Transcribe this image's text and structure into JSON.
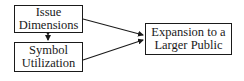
{
  "diagram": {
    "nodes": [
      {
        "id": "issue_dimensions",
        "lines": [
          "Issue",
          "Dimensions"
        ]
      },
      {
        "id": "symbol_utilization",
        "lines": [
          "Symbol",
          "Utilization"
        ]
      },
      {
        "id": "expansion",
        "lines": [
          "Expansion to a",
          "Larger Public"
        ]
      }
    ],
    "edges": [
      {
        "from": "issue_dimensions",
        "to": "symbol_utilization",
        "type": "bidirectional"
      },
      {
        "from": "issue_dimensions",
        "to": "expansion",
        "type": "directed"
      },
      {
        "from": "symbol_utilization",
        "to": "expansion",
        "type": "directed"
      }
    ],
    "colors": {
      "stroke": "#1a1a1a",
      "background": "#ffffff"
    }
  }
}
